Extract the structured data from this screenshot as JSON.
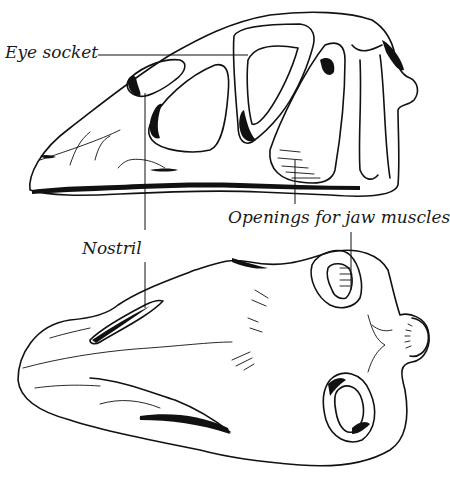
{
  "figure": {
    "type": "anatomical-illustration",
    "views": [
      "side view",
      "top view"
    ],
    "labels": {
      "eye_socket": "Eye socket",
      "openings": "Openings for jaw muscles",
      "nostril": "Nostril"
    },
    "colors": {
      "ink": "#111111",
      "background": "#ffffff"
    }
  }
}
